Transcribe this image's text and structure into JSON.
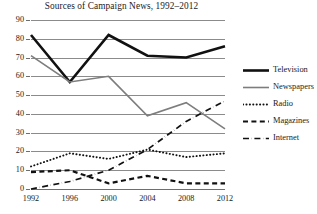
{
  "chart_data": {
    "type": "line",
    "title": "Sources of Campaign News, 1992–2012",
    "xlabel": "",
    "ylabel": "",
    "x": [
      1992,
      1996,
      2000,
      2004,
      2008,
      2012
    ],
    "categories": [
      "1992",
      "1996",
      "2000",
      "2004",
      "2008",
      "2012"
    ],
    "xtick_labels": [
      "1992",
      "1996",
      "2000",
      "2004",
      "2008",
      "2012"
    ],
    "ytick_labels": [
      "0",
      "10",
      "20",
      "30",
      "40",
      "50",
      "60",
      "70",
      "80",
      "90"
    ],
    "yticks": [
      0,
      10,
      20,
      30,
      40,
      50,
      60,
      70,
      80,
      90
    ],
    "ylim": [
      0,
      90
    ],
    "xlim": [
      1992,
      2012
    ],
    "grid": "horizontal",
    "legend_position": "right",
    "series": [
      {
        "name": "Television",
        "values": [
          82,
          57,
          82,
          71,
          70,
          76
        ],
        "color": "#111111",
        "width": 2.6,
        "dash": "none",
        "style_name": "thick-solid-black"
      },
      {
        "name": "Newspapers",
        "values": [
          71,
          57,
          60,
          39,
          46,
          32
        ],
        "color": "#7d7d7d",
        "width": 1.6,
        "dash": "none",
        "style_name": "thin-solid-gray"
      },
      {
        "name": "Radio",
        "values": [
          12,
          19,
          16,
          21,
          17,
          19
        ],
        "color": "#111111",
        "width": 1.9,
        "dash": "0.2,3.2",
        "style_name": "dotted-black"
      },
      {
        "name": "Magazines",
        "values": [
          9,
          10,
          3,
          7,
          3,
          3
        ],
        "color": "#111111",
        "width": 2.2,
        "dash": "5,3.4",
        "style_name": "dashed-black"
      },
      {
        "name": "Internet",
        "values": [
          0,
          4,
          10,
          21,
          36,
          47
        ],
        "color": "#111111",
        "width": 1.7,
        "dash": "6,2.6,0.2,2.6",
        "style_name": "dash-dot-black"
      }
    ]
  },
  "legend": {
    "entries": [
      {
        "label": "Television"
      },
      {
        "label": "Newspapers"
      },
      {
        "label": "Radio"
      },
      {
        "label": "Magazines"
      },
      {
        "label": "Internet"
      }
    ]
  },
  "colors": {
    "gridline": "#8b8b8b",
    "axis": "#6e6e6e",
    "text": "#1a1a1a",
    "background": "#ffffff"
  }
}
